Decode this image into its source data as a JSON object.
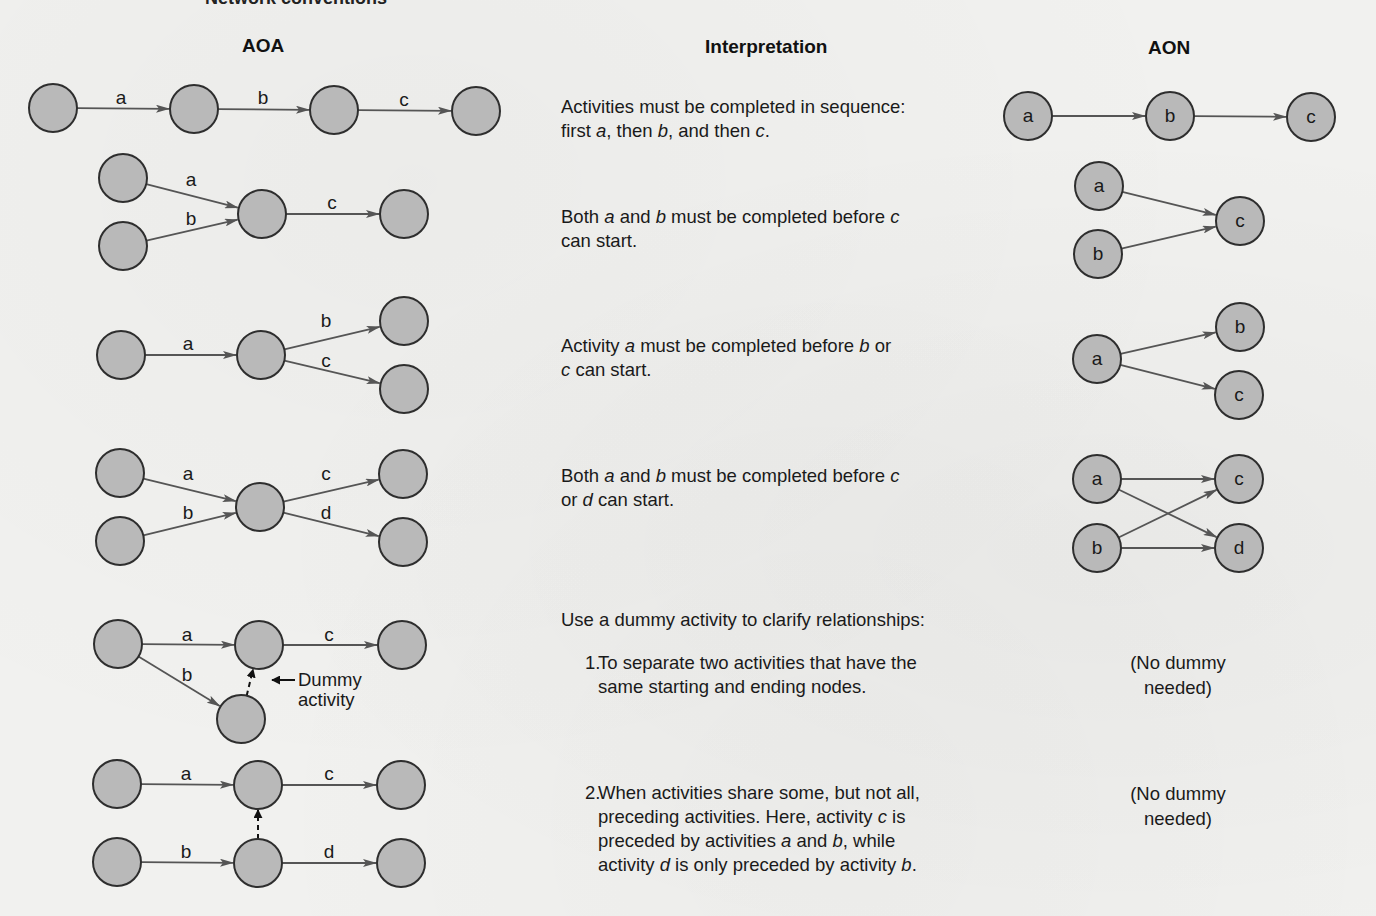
{
  "figure": {
    "partial_title": "Network conventions",
    "colors": {
      "background": "#f1f1ef",
      "node_fill": "#b9b9b9",
      "node_stroke": "#2e2e2e",
      "arrow": "#555555",
      "text": "#1a1a1a"
    }
  },
  "columns": {
    "aoa": "AOA",
    "interpretation": "Interpretation",
    "aon": "AON"
  },
  "rows": [
    {
      "interpretation": [
        "Activities must be completed in sequence:",
        "first ",
        "a",
        ", then ",
        "b",
        ", and then ",
        "c",
        "."
      ],
      "interpretation_text": "Activities must be completed in sequence: first a, then b, and then c."
    },
    {
      "interpretation_text": "Both a and b must be completed before c can start."
    },
    {
      "interpretation_text": "Activity a must be completed before b or c can start."
    },
    {
      "interpretation_text": "Both a and b must be completed before c or d can start."
    }
  ],
  "dummy_section": {
    "heading": "Use a dummy activity to clarify relationships:",
    "items": [
      {
        "number": "1.",
        "text_line1": "To separate two activities that have the",
        "text_line2": "same starting and ending nodes.",
        "aon_note_line1": "(No dummy",
        "aon_note_line2": "needed)"
      },
      {
        "number": "2.",
        "text_line1": "When activities share some, but not all,",
        "text_line2_a": "preceding activities. Here, activity ",
        "text_line2_b": "c",
        "text_line2_c": " is",
        "text_line3_a": "preceded by activities ",
        "text_line3_b": "a",
        "text_line3_c": " and ",
        "text_line3_d": "b",
        "text_line3_e": ", while",
        "text_line4_a": "activity ",
        "text_line4_b": "d",
        "text_line4_c": " is only preceded by activity ",
        "text_line4_d": "b",
        "text_line4_e": ".",
        "aon_note_line1": "(No dummy",
        "aon_note_line2": "needed)"
      }
    ],
    "dummy_callout_line1": "Dummy",
    "dummy_callout_line2": "activity"
  },
  "diagram": {
    "node_radius": 24,
    "aoa": {
      "nodes": [
        {
          "id": "r1n1",
          "x": 53,
          "y": 108
        },
        {
          "id": "r1n2",
          "x": 194,
          "y": 109
        },
        {
          "id": "r1n3",
          "x": 334,
          "y": 110
        },
        {
          "id": "r1n4",
          "x": 476,
          "y": 111
        },
        {
          "id": "r2n1",
          "x": 123,
          "y": 178
        },
        {
          "id": "r2n2",
          "x": 123,
          "y": 246
        },
        {
          "id": "r2n3",
          "x": 262,
          "y": 214
        },
        {
          "id": "r2n4",
          "x": 404,
          "y": 214
        },
        {
          "id": "r3n1",
          "x": 121,
          "y": 355
        },
        {
          "id": "r3n2",
          "x": 261,
          "y": 355
        },
        {
          "id": "r3n3",
          "x": 404,
          "y": 321
        },
        {
          "id": "r3n4",
          "x": 404,
          "y": 389
        },
        {
          "id": "r4n1",
          "x": 120,
          "y": 473
        },
        {
          "id": "r4n2",
          "x": 120,
          "y": 541
        },
        {
          "id": "r4n3",
          "x": 260,
          "y": 507
        },
        {
          "id": "r4n4",
          "x": 403,
          "y": 474
        },
        {
          "id": "r4n5",
          "x": 403,
          "y": 542
        },
        {
          "id": "r5n1",
          "x": 118,
          "y": 644
        },
        {
          "id": "r5n2",
          "x": 259,
          "y": 645
        },
        {
          "id": "r5n3",
          "x": 402,
          "y": 645
        },
        {
          "id": "r5n4",
          "x": 241,
          "y": 719
        },
        {
          "id": "r6n1",
          "x": 117,
          "y": 784
        },
        {
          "id": "r6n2",
          "x": 258,
          "y": 785
        },
        {
          "id": "r6n3",
          "x": 401,
          "y": 785
        },
        {
          "id": "r6n4",
          "x": 117,
          "y": 862
        },
        {
          "id": "r6n5",
          "x": 258,
          "y": 863
        },
        {
          "id": "r6n6",
          "x": 401,
          "y": 863
        }
      ],
      "edges": [
        {
          "from": "r1n1",
          "to": "r1n2",
          "label": "a",
          "lx": 121,
          "ly": 104
        },
        {
          "from": "r1n2",
          "to": "r1n3",
          "label": "b",
          "lx": 263,
          "ly": 104
        },
        {
          "from": "r1n3",
          "to": "r1n4",
          "label": "c",
          "lx": 404,
          "ly": 106
        },
        {
          "from": "r2n1",
          "to": "r2n3",
          "label": "a",
          "lx": 191,
          "ly": 186
        },
        {
          "from": "r2n2",
          "to": "r2n3",
          "label": "b",
          "lx": 191,
          "ly": 225
        },
        {
          "from": "r2n3",
          "to": "r2n4",
          "label": "c",
          "lx": 332,
          "ly": 209
        },
        {
          "from": "r3n1",
          "to": "r3n2",
          "label": "a",
          "lx": 188,
          "ly": 350
        },
        {
          "from": "r3n2",
          "to": "r3n3",
          "label": "b",
          "lx": 326,
          "ly": 327
        },
        {
          "from": "r3n2",
          "to": "r3n4",
          "label": "c",
          "lx": 326,
          "ly": 367
        },
        {
          "from": "r4n1",
          "to": "r4n3",
          "label": "a",
          "lx": 188,
          "ly": 480
        },
        {
          "from": "r4n2",
          "to": "r4n3",
          "label": "b",
          "lx": 188,
          "ly": 519
        },
        {
          "from": "r4n3",
          "to": "r4n4",
          "label": "c",
          "lx": 326,
          "ly": 480
        },
        {
          "from": "r4n3",
          "to": "r4n5",
          "label": "d",
          "lx": 326,
          "ly": 519
        },
        {
          "from": "r5n1",
          "to": "r5n2",
          "label": "a",
          "lx": 187,
          "ly": 641
        },
        {
          "from": "r5n2",
          "to": "r5n3",
          "label": "c",
          "lx": 329,
          "ly": 641
        },
        {
          "from": "r5n1",
          "to": "r5n4",
          "label": "b",
          "lx": 187,
          "ly": 681
        },
        {
          "from": "r5n4",
          "to": "r5n2",
          "label": "",
          "dashed": true
        },
        {
          "from": "r6n1",
          "to": "r6n2",
          "label": "a",
          "lx": 186,
          "ly": 780
        },
        {
          "from": "r6n2",
          "to": "r6n3",
          "label": "c",
          "lx": 329,
          "ly": 780
        },
        {
          "from": "r6n4",
          "to": "r6n5",
          "label": "b",
          "lx": 186,
          "ly": 858
        },
        {
          "from": "r6n5",
          "to": "r6n6",
          "label": "d",
          "lx": 329,
          "ly": 858
        },
        {
          "from": "r6n5",
          "to": "r6n2",
          "label": "",
          "dashed": true
        }
      ],
      "callout_arrow": {
        "x1": 295,
        "y1": 680,
        "x2": 272,
        "y2": 680
      }
    },
    "aon": {
      "nodes": [
        {
          "id": "A1a",
          "x": 1028,
          "y": 116,
          "label": "a"
        },
        {
          "id": "A1b",
          "x": 1170,
          "y": 116,
          "label": "b"
        },
        {
          "id": "A1c",
          "x": 1311,
          "y": 117,
          "label": "c"
        },
        {
          "id": "A2a",
          "x": 1099,
          "y": 186,
          "label": "a"
        },
        {
          "id": "A2b",
          "x": 1098,
          "y": 254,
          "label": "b"
        },
        {
          "id": "A2c",
          "x": 1240,
          "y": 221,
          "label": "c"
        },
        {
          "id": "A3b",
          "x": 1240,
          "y": 327,
          "label": "b"
        },
        {
          "id": "A3a",
          "x": 1097,
          "y": 359,
          "label": "a"
        },
        {
          "id": "A3c",
          "x": 1239,
          "y": 395,
          "label": "c"
        },
        {
          "id": "A4a",
          "x": 1097,
          "y": 479,
          "label": "a"
        },
        {
          "id": "A4c",
          "x": 1239,
          "y": 479,
          "label": "c"
        },
        {
          "id": "A4b",
          "x": 1097,
          "y": 548,
          "label": "b"
        },
        {
          "id": "A4d",
          "x": 1239,
          "y": 548,
          "label": "d"
        }
      ],
      "edges": [
        {
          "from": "A1a",
          "to": "A1b"
        },
        {
          "from": "A1b",
          "to": "A1c"
        },
        {
          "from": "A2a",
          "to": "A2c"
        },
        {
          "from": "A2b",
          "to": "A2c"
        },
        {
          "from": "A3a",
          "to": "A3b"
        },
        {
          "from": "A3a",
          "to": "A3c"
        },
        {
          "from": "A4a",
          "to": "A4c"
        },
        {
          "from": "A4a",
          "to": "A4d"
        },
        {
          "from": "A4b",
          "to": "A4c"
        },
        {
          "from": "A4b",
          "to": "A4d"
        }
      ]
    }
  }
}
